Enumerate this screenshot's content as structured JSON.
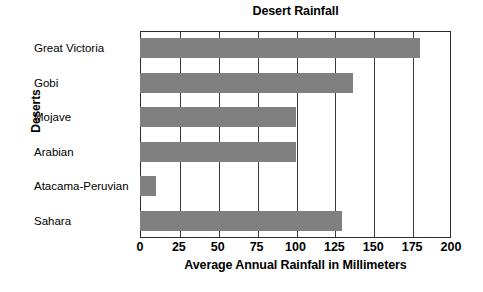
{
  "chart_data": {
    "type": "bar",
    "orientation": "horizontal",
    "title": "Desert Rainfall",
    "xlabel": "Average Annual Rainfall in Millimeters",
    "ylabel": "Deserts",
    "categories": [
      "Great Victoria",
      "Gobi",
      "Mojave",
      "Arabian",
      "Atacama-Peruvian",
      "Sahara"
    ],
    "values": [
      180,
      137,
      100,
      100,
      10,
      130
    ],
    "xlim": [
      0,
      200
    ],
    "xticks": [
      0,
      25,
      50,
      75,
      100,
      125,
      150,
      175,
      200
    ],
    "xtick_labels": [
      "0",
      "25",
      "50",
      "75",
      "100",
      "125",
      "150",
      "175",
      "200"
    ],
    "grid": "vertical",
    "legend": "none",
    "bar_color": "#808080",
    "frame_color": "#2b2b2b",
    "background_color": "#ffffff"
  }
}
